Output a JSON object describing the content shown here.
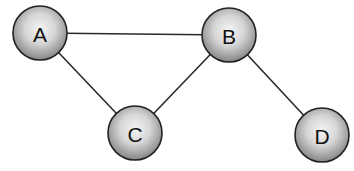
{
  "diagram": {
    "type": "undirected-graph",
    "nodes": [
      {
        "id": "A",
        "label": "A",
        "cx": 40,
        "cy": 33,
        "r": 27
      },
      {
        "id": "B",
        "label": "B",
        "cx": 229,
        "cy": 35,
        "r": 27
      },
      {
        "id": "C",
        "label": "C",
        "cx": 135,
        "cy": 133,
        "r": 27
      },
      {
        "id": "D",
        "label": "D",
        "cx": 322,
        "cy": 135,
        "r": 27
      }
    ],
    "edges": [
      {
        "from": "A",
        "to": "B"
      },
      {
        "from": "A",
        "to": "C"
      },
      {
        "from": "B",
        "to": "C"
      },
      {
        "from": "B",
        "to": "D"
      }
    ],
    "colors": {
      "background": "#ffffff",
      "edge": "#2a2a2a",
      "node_stroke": "#222222",
      "node_fill_light": "#f2f2f2",
      "node_fill_dark": "#7a7a7a",
      "label": "#111111"
    }
  }
}
